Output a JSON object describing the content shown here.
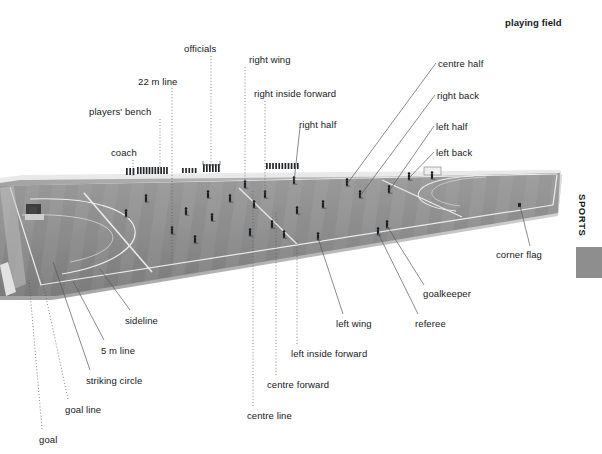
{
  "page": {
    "title": "playing field",
    "side_tab": "SPORTS",
    "background_color": "#ffffff",
    "field_color": "#8a8a8a",
    "line_color": "#f0f0f0",
    "leader_color": "#555a60"
  },
  "labels": [
    {
      "id": "coach",
      "text": "coach",
      "x": 111,
      "y": 147,
      "align": "left"
    },
    {
      "id": "players-bench",
      "text": "players' bench",
      "x": 89,
      "y": 106,
      "align": "left"
    },
    {
      "id": "22m-line",
      "text": "22 m line",
      "x": 138,
      "y": 76,
      "align": "left"
    },
    {
      "id": "officials",
      "text": "officials",
      "x": 184,
      "y": 43,
      "align": "left"
    },
    {
      "id": "right-wing",
      "text": "right wing",
      "x": 249,
      "y": 54,
      "align": "left"
    },
    {
      "id": "right-inside-forward",
      "text": "right inside forward",
      "x": 254,
      "y": 88,
      "align": "left"
    },
    {
      "id": "right-half",
      "text": "right half",
      "x": 299,
      "y": 119,
      "align": "left"
    },
    {
      "id": "centre-half",
      "text": "centre half",
      "x": 438,
      "y": 58,
      "align": "left"
    },
    {
      "id": "right-back",
      "text": "right back",
      "x": 437,
      "y": 90,
      "align": "left"
    },
    {
      "id": "left-half",
      "text": "left half",
      "x": 436,
      "y": 121,
      "align": "left"
    },
    {
      "id": "left-back",
      "text": "left back",
      "x": 436,
      "y": 147,
      "align": "left"
    },
    {
      "id": "corner-flag",
      "text": "corner flag",
      "x": 496,
      "y": 249,
      "align": "left"
    },
    {
      "id": "goalkeeper",
      "text": "goalkeeper",
      "x": 423,
      "y": 288,
      "align": "left"
    },
    {
      "id": "referee",
      "text": "referee",
      "x": 415,
      "y": 318,
      "align": "left"
    },
    {
      "id": "left-wing",
      "text": "left wing",
      "x": 336,
      "y": 318,
      "align": "left"
    },
    {
      "id": "left-inside-forward",
      "text": "left inside forward",
      "x": 291,
      "y": 348,
      "align": "left"
    },
    {
      "id": "centre-forward",
      "text": "centre forward",
      "x": 267,
      "y": 379,
      "align": "left"
    },
    {
      "id": "centre-line",
      "text": "centre line",
      "x": 247,
      "y": 410,
      "align": "left"
    },
    {
      "id": "sideline",
      "text": "sideline",
      "x": 125,
      "y": 315,
      "align": "left"
    },
    {
      "id": "5m-line",
      "text": "5 m line",
      "x": 101,
      "y": 345,
      "align": "left"
    },
    {
      "id": "striking-circle",
      "text": "striking circle",
      "x": 86,
      "y": 375,
      "align": "left"
    },
    {
      "id": "goal-line",
      "text": "goal line",
      "x": 65,
      "y": 404,
      "align": "left"
    },
    {
      "id": "goal",
      "text": "goal",
      "x": 39,
      "y": 434,
      "align": "left"
    }
  ],
  "leaders": [
    {
      "id": "coach-leader",
      "type": "dotted",
      "points": "133,160 133,176"
    },
    {
      "id": "players-bench-leader",
      "type": "dotted",
      "points": "160,119 160,174"
    },
    {
      "id": "22m-line-leader",
      "type": "dotted",
      "points": "172,88 172,262"
    },
    {
      "id": "officials-leader",
      "type": "dotted",
      "points": "211,56 211,165"
    },
    {
      "id": "officials-bracket",
      "type": "bracket",
      "points": "203,161 203,165 220,165 220,161"
    },
    {
      "id": "right-wing-leader",
      "type": "dotted",
      "points": "245,67 245,186"
    },
    {
      "id": "right-inside-forward-leader",
      "type": "dotted",
      "points": "265,101 265,196"
    },
    {
      "id": "right-half-leader",
      "type": "solid",
      "points": "300,127 294,182"
    },
    {
      "id": "centre-half-leader",
      "type": "solid",
      "points": "436,63 347,184"
    },
    {
      "id": "right-back-leader",
      "type": "solid",
      "points": "435,95 360,196"
    },
    {
      "id": "left-half-leader",
      "type": "solid",
      "points": "434,126 389,191"
    },
    {
      "id": "left-back-leader",
      "type": "solid",
      "points": "434,152 409,178"
    },
    {
      "id": "corner-flag-leader",
      "type": "solid",
      "points": "530,246 520,206"
    },
    {
      "id": "goalkeeper-leader",
      "type": "solid",
      "points": "424,285 387,226"
    },
    {
      "id": "referee-leader",
      "type": "solid",
      "points": "418,314 378,233"
    },
    {
      "id": "left-wing-leader",
      "type": "solid",
      "points": "343,314 318,238"
    },
    {
      "id": "left-inside-forward-leader",
      "type": "dotted",
      "points": "297,344 297,240"
    },
    {
      "id": "centre-forward-leader",
      "type": "dotted",
      "points": "276,375 276,212"
    },
    {
      "id": "centre-line-leader",
      "type": "dotted",
      "points": "253,406 253,190"
    },
    {
      "id": "sideline-leader",
      "type": "solid",
      "points": "130,310 100,269"
    },
    {
      "id": "5m-line-leader",
      "type": "solid",
      "points": "104,340 73,281"
    },
    {
      "id": "striking-circle-leader",
      "type": "solid",
      "points": "90,370 53,262"
    },
    {
      "id": "goal-line-leader",
      "type": "dotted",
      "points": "68,399 41,274"
    },
    {
      "id": "goal-leader",
      "type": "dotted",
      "points": "42,429 29,280"
    }
  ],
  "field": {
    "outline": "0,182 24,177 558,172 558,214 54,297 0,297",
    "playing_surface": "0,186 560,173 558,213 56,296 0,296",
    "markings": [
      {
        "id": "far-sideline",
        "d": "M 12,184 L 556,174"
      },
      {
        "id": "near-sideline",
        "d": "M 42,284 L 552,204"
      },
      {
        "id": "left-goal-line",
        "d": "M 14,186 L 44,284"
      },
      {
        "id": "right-goal-line",
        "d": "M 556,175 L 552,205"
      },
      {
        "id": "22m-left",
        "d": "M 86,192 L 151,270"
      },
      {
        "id": "22m-right",
        "d": "M 380,181 L 460,218"
      },
      {
        "id": "centre-line",
        "d": "M 240,187 L 296,244"
      },
      {
        "id": "circle-left",
        "d": "M 37,200 C 170,196 172,260 66,272"
      },
      {
        "id": "circle-right",
        "d": "M 470,177 C 400,180 398,207 455,211"
      }
    ],
    "goals": [
      {
        "id": "near-goal",
        "x": 26,
        "y": 205,
        "w": 17,
        "h": 14
      },
      {
        "id": "far-goal",
        "x": 424,
        "y": 167,
        "w": 18,
        "h": 8
      }
    ],
    "bench_groups": [
      {
        "id": "coach-group",
        "x": 126,
        "y": 168,
        "w": 10,
        "h": 7
      },
      {
        "id": "bench-group",
        "x": 137,
        "y": 167,
        "w": 32,
        "h": 7
      },
      {
        "id": "officials-group",
        "x": 203,
        "y": 164,
        "w": 18,
        "h": 8
      },
      {
        "id": "spectators-a",
        "x": 182,
        "y": 168,
        "w": 16,
        "h": 5
      },
      {
        "id": "spectators-b",
        "x": 266,
        "y": 163,
        "w": 34,
        "h": 6
      }
    ],
    "players": [
      {
        "id": "p01",
        "x": 126,
        "y": 215
      },
      {
        "id": "p02",
        "x": 146,
        "y": 200
      },
      {
        "id": "p03",
        "x": 172,
        "y": 232
      },
      {
        "id": "p04",
        "x": 186,
        "y": 213
      },
      {
        "id": "p05",
        "x": 195,
        "y": 241
      },
      {
        "id": "p06",
        "x": 208,
        "y": 196
      },
      {
        "id": "p07",
        "x": 212,
        "y": 219
      },
      {
        "id": "p08",
        "x": 230,
        "y": 200
      },
      {
        "id": "p09",
        "x": 245,
        "y": 186
      },
      {
        "id": "p10",
        "x": 250,
        "y": 234
      },
      {
        "id": "p11",
        "x": 254,
        "y": 206
      },
      {
        "id": "p12",
        "x": 265,
        "y": 196
      },
      {
        "id": "p13",
        "x": 272,
        "y": 226
      },
      {
        "id": "p14",
        "x": 284,
        "y": 236
      },
      {
        "id": "p15",
        "x": 294,
        "y": 182
      },
      {
        "id": "p16",
        "x": 297,
        "y": 212
      },
      {
        "id": "p17",
        "x": 318,
        "y": 238
      },
      {
        "id": "p18",
        "x": 323,
        "y": 206
      },
      {
        "id": "p19",
        "x": 347,
        "y": 184
      },
      {
        "id": "p20",
        "x": 360,
        "y": 196
      },
      {
        "id": "p21",
        "x": 378,
        "y": 233
      },
      {
        "id": "p22",
        "x": 387,
        "y": 226
      },
      {
        "id": "p23",
        "x": 389,
        "y": 191
      },
      {
        "id": "p24",
        "x": 409,
        "y": 178
      },
      {
        "id": "p25",
        "x": 432,
        "y": 177
      }
    ],
    "corner_flag": {
      "id": "corner-flag-marker",
      "x": 520,
      "y": 205
    }
  },
  "side_panel": {
    "tab_label": "SPORTS",
    "tab_x": 582,
    "tab_y": 194,
    "box": {
      "x": 576,
      "y": 247,
      "w": 26,
      "h": 31,
      "color": "#8e8e8e"
    }
  }
}
